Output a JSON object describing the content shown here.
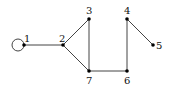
{
  "diagram": {
    "type": "graph",
    "nodes": [
      {
        "id": "1",
        "label": "1",
        "x": 24,
        "y": 45
      },
      {
        "id": "2",
        "label": "2",
        "x": 63,
        "y": 45
      },
      {
        "id": "3",
        "label": "3",
        "x": 89,
        "y": 19
      },
      {
        "id": "4",
        "label": "4",
        "x": 127,
        "y": 19
      },
      {
        "id": "5",
        "label": "5",
        "x": 153,
        "y": 45
      },
      {
        "id": "6",
        "label": "6",
        "x": 127,
        "y": 71
      },
      {
        "id": "7",
        "label": "7",
        "x": 89,
        "y": 71
      }
    ],
    "edges": [
      {
        "from": "1",
        "to": "1",
        "kind": "loop"
      },
      {
        "from": "1",
        "to": "2"
      },
      {
        "from": "2",
        "to": "3"
      },
      {
        "from": "2",
        "to": "7"
      },
      {
        "from": "3",
        "to": "7"
      },
      {
        "from": "7",
        "to": "6"
      },
      {
        "from": "6",
        "to": "4"
      },
      {
        "from": "4",
        "to": "5"
      }
    ]
  }
}
